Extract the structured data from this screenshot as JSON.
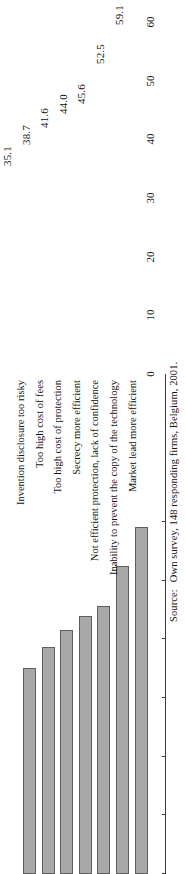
{
  "chart_data": {
    "type": "bar",
    "orientation": "horizontal-on-page",
    "title": "",
    "xlabel": "",
    "ylabel": "",
    "categories": [
      "Invention disclosure too risky",
      "Too high cost of fees",
      "Too high cost of protection",
      "Secrecy more efficient",
      "Not efficient protection, lack of confidence",
      "Inability to prevent the copy of the technology",
      "Market lead more efficient"
    ],
    "values": [
      35.1,
      38.7,
      41.6,
      44.0,
      45.6,
      52.5,
      59.1
    ],
    "value_labels": [
      "35.1",
      "38.7",
      "41.6",
      "44.0",
      "45.6",
      "52.5",
      "59.1"
    ],
    "ticks": [
      0,
      10,
      20,
      30,
      40,
      50,
      60
    ],
    "tick_labels": [
      "0",
      "10",
      "20",
      "30",
      "40",
      "50",
      "60"
    ],
    "ylim": [
      0,
      63
    ],
    "grid": false,
    "legend": null,
    "bar_color": "#a8a8a8",
    "bar_edge_color": "#5e5e5e",
    "axis_color": "#3a3a3a"
  },
  "source": {
    "lead": "Source:",
    "text": "Own survey, 148 responding firms, Belgium, 2001."
  }
}
